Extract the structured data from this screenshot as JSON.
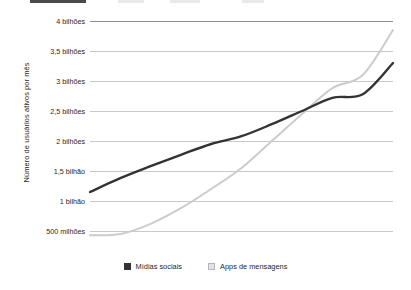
{
  "header": {
    "cropped_bar": ""
  },
  "legend": {
    "items": [
      {
        "label": "Mídias sociais",
        "swatch": "dark-square-icon",
        "color": "#333333"
      },
      {
        "label": "Apps de mensagens",
        "swatch": "light-square-icon",
        "color": "#e2e2e2"
      }
    ]
  },
  "axis": {
    "y_title": "Número de usuários ativos por mês"
  },
  "chart_data": {
    "type": "line",
    "title": "",
    "xlabel": "",
    "ylabel": "Número de usuários ativos por mês",
    "ylim": [
      0,
      4000000000
    ],
    "ytick_values": [
      500000000,
      1000000000,
      1500000000,
      2000000000,
      2500000000,
      3000000000,
      3500000000,
      4000000000
    ],
    "ytick_labels": [
      "500 milhões",
      "1 bilhão",
      "1,5 bilhão",
      "2 bilhões",
      "2,5 bilhões",
      "3 bilhões",
      "3,5 bilhões",
      "4 bilhões"
    ],
    "grid": true,
    "legend_position": "bottom-center",
    "x": [
      0,
      1,
      2,
      3,
      4,
      5,
      6,
      7,
      8,
      9,
      10
    ],
    "series": [
      {
        "name": "Mídias sociais",
        "color": "#333333",
        "values": [
          1.15,
          1.38,
          1.58,
          1.77,
          1.95,
          2.08,
          2.28,
          2.5,
          2.72,
          2.78,
          3.3
        ]
      },
      {
        "name": "Apps de mensagens",
        "color": "#cccccc",
        "values": [
          0.43,
          0.45,
          0.62,
          0.88,
          1.2,
          1.55,
          2.0,
          2.45,
          2.88,
          3.1,
          3.85
        ]
      }
    ],
    "value_unit": "bilhões de usuários ativos por mês"
  }
}
